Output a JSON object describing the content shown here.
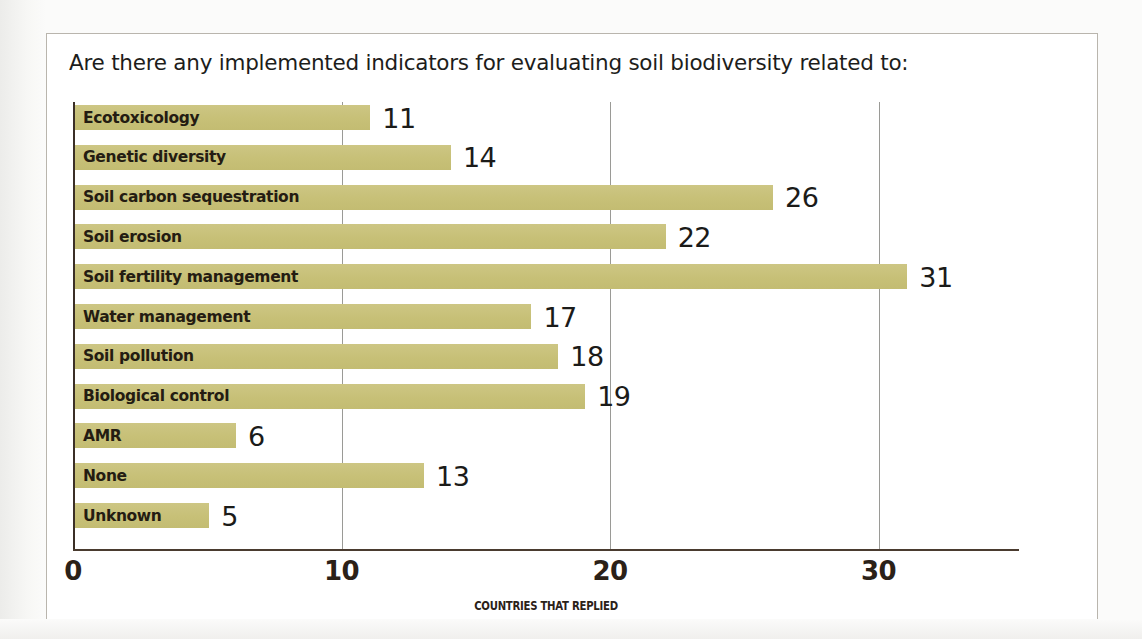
{
  "chart_title": "Are there any implemented indicators for evaluating soil biodiversity related to:",
  "chart_data": {
    "type": "bar",
    "orientation": "horizontal",
    "title": "Are there any implemented indicators for evaluating soil biodiversity related to:",
    "xlabel": "COUNTRIES THAT REPLIED",
    "ylabel": "",
    "xlim": [
      0,
      35
    ],
    "xticks": [
      0,
      10,
      20,
      30
    ],
    "xtick_labels": [
      "0",
      "10",
      "20",
      "30"
    ],
    "grid": true,
    "grid_axis": "x",
    "legend": false,
    "bar_color": "#c9c27c",
    "categories": [
      "Ecotoxicology",
      "Genetic diversity",
      "Soil carbon sequestration",
      "Soil erosion",
      "Soil fertility management",
      "Water management",
      "Soil pollution",
      "Biological control",
      "AMR",
      "None",
      "Unknown"
    ],
    "values": [
      11,
      14,
      26,
      22,
      31,
      17,
      18,
      19,
      6,
      13,
      5
    ],
    "data_labels": [
      "11",
      "14",
      "26",
      "22",
      "31",
      "17",
      "18",
      "19",
      "6",
      "13",
      "5"
    ]
  }
}
